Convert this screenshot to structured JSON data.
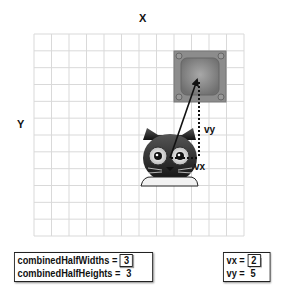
{
  "labels": {
    "x_axis": "X",
    "y_axis": "Y",
    "vx": "vx",
    "vy": "vy"
  },
  "grid": {
    "columns": 12,
    "rows": 12
  },
  "objects": {
    "cat": {
      "name": "cat sprite",
      "grid_col": 7.5,
      "grid_row": 7.3
    },
    "box": {
      "name": "box sprite",
      "grid_col": 9.5,
      "grid_row": 2.5
    }
  },
  "info_left": {
    "rows": [
      {
        "label": "combinedHalfWidths =",
        "value": "3",
        "boxed": true
      },
      {
        "label": "combinedHalfHeights =",
        "value": "3",
        "boxed": false
      }
    ]
  },
  "info_right": {
    "rows": [
      {
        "label": "vx =",
        "value": "2",
        "boxed": true
      },
      {
        "label": "vy =",
        "value": "5",
        "boxed": false
      }
    ]
  },
  "colors": {
    "grid_line": "#d9d9d9",
    "box_fill": "#8a8a8a",
    "box_inner": "#9c9c9c",
    "arrow": "#111111"
  }
}
